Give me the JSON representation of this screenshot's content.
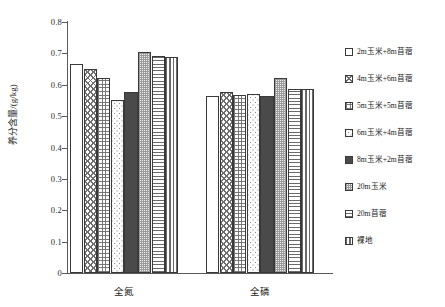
{
  "chart_data": {
    "type": "bar",
    "title": "",
    "xlabel": "",
    "ylabel": "养分含量/(g/kg)",
    "ylim": [
      0,
      0.8
    ],
    "ytick_values": [
      0.8,
      0.7,
      0.6,
      0.5,
      0.4,
      0.3,
      0.2,
      0.1,
      0
    ],
    "ytick_labels": [
      "0.8",
      "0.7",
      "0.6",
      "0.5",
      "0.4",
      "0.3",
      "0.2",
      "0.1",
      "0"
    ],
    "grid": false,
    "legend_position": "right",
    "categories": [
      "全氮",
      "全磷"
    ],
    "series": [
      {
        "name": "2m玉米+8m苜蓿",
        "pattern": "blank",
        "values": [
          0.665,
          0.565
        ]
      },
      {
        "name": "4m玉米+6m苜蓿",
        "pattern": "check",
        "values": [
          0.65,
          0.578
        ]
      },
      {
        "name": "5m玉米+5m苜蓿",
        "pattern": "grid",
        "values": [
          0.622,
          0.568
        ]
      },
      {
        "name": "6m玉米+4m苜蓿",
        "pattern": "dot",
        "values": [
          0.55,
          0.572
        ]
      },
      {
        "name": "8m玉米+2m苜蓿",
        "pattern": "solid",
        "values": [
          0.578,
          0.565
        ]
      },
      {
        "name": "20m玉米",
        "pattern": "fine",
        "values": [
          0.705,
          0.62
        ]
      },
      {
        "name": "20m苜蓿",
        "pattern": "hline",
        "values": [
          0.692,
          0.587
        ]
      },
      {
        "name": "裸地",
        "pattern": "vline",
        "values": [
          0.687,
          0.587
        ]
      }
    ]
  }
}
